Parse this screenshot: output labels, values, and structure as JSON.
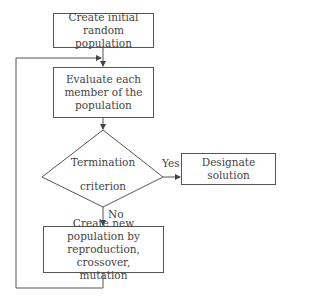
{
  "flowchart": {
    "nodes": {
      "init": {
        "type": "process",
        "line1": "Create initial",
        "line2": "random population"
      },
      "evaluate": {
        "type": "process",
        "line1": "Evaluate each",
        "line2": "member of the",
        "line3": "population"
      },
      "termination": {
        "type": "decision",
        "line1": "Termination",
        "line2": "criterion"
      },
      "designate": {
        "type": "process",
        "text": "Designate solution"
      },
      "newpop": {
        "type": "process",
        "line1": "Create new population by",
        "line2": "reproduction, crossover,",
        "line3": "mutation"
      }
    },
    "edges": {
      "yes_label": "Yes",
      "no_label": "No"
    },
    "colors": {
      "line": "#555555",
      "text": "#444444",
      "background": "#ffffff"
    }
  }
}
